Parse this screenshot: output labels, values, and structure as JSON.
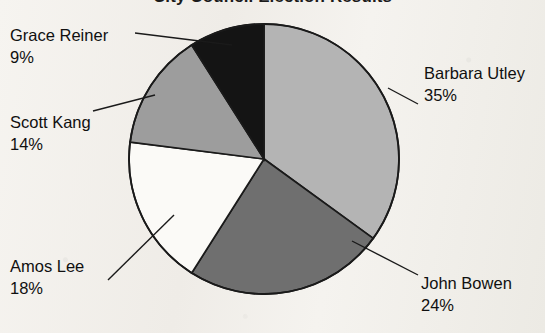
{
  "chart_data": {
    "type": "pie",
    "title": "City Council Election Results",
    "title_clipped": true,
    "categories": [
      "Barbara Utley",
      "John Bowen",
      "Amos Lee",
      "Scott Kang",
      "Grace Reiner"
    ],
    "values": [
      35,
      24,
      18,
      14,
      9
    ],
    "value_unit": "%",
    "value_labels": [
      "35%",
      "24%",
      "18%",
      "14%",
      "9%"
    ],
    "start_angle_clock": "12 o'clock",
    "direction": "clockwise",
    "legend": "none (direct labels with leader lines)",
    "grid": false,
    "slice_colors": [
      "#b4b4b4",
      "#6f6f6f",
      "#fbfaf7",
      "#9d9d9d",
      "#141414"
    ],
    "outline_color": "#1a1a1a",
    "background_color": "#f3f1ed",
    "slices": [
      {
        "name": "Barbara Utley",
        "value": 35,
        "label": "35%",
        "fill": "#b4b4b4",
        "label_position": "right"
      },
      {
        "name": "John Bowen",
        "value": 24,
        "label": "24%",
        "fill": "#6f6f6f",
        "label_position": "bottom-right"
      },
      {
        "name": "Amos Lee",
        "value": 18,
        "label": "18%",
        "fill": "#fbfaf7",
        "label_position": "bottom-left"
      },
      {
        "name": "Scott Kang",
        "value": 14,
        "label": "14%",
        "fill": "#9d9d9d",
        "label_position": "left"
      },
      {
        "name": "Grace Reiner",
        "value": 9,
        "label": "9%",
        "fill": "#141414",
        "label_position": "top-left"
      }
    ]
  },
  "labels": {
    "grace": {
      "name": "Grace Reiner",
      "value": "9%"
    },
    "scott": {
      "name": "Scott Kang",
      "value": "14%"
    },
    "amos": {
      "name": "Amos Lee",
      "value": "18%"
    },
    "barbara": {
      "name": "Barbara Utley",
      "value": "35%"
    },
    "john": {
      "name": "John Bowen",
      "value": "24%"
    }
  },
  "title": {
    "text": "City Council Election Results"
  }
}
